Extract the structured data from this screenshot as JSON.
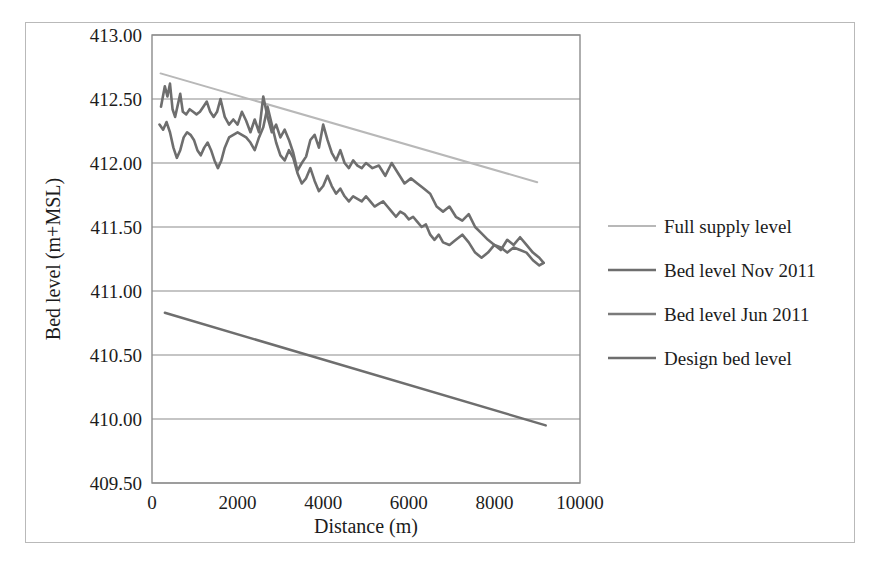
{
  "chart_data": {
    "type": "line",
    "title": "",
    "xlabel": "Distance (m)",
    "ylabel": "Bed level (m+MSL)",
    "xlim": [
      0,
      10000
    ],
    "ylim": [
      409.5,
      413.0
    ],
    "xticks": [
      "0",
      "2000",
      "4000",
      "6000",
      "8000",
      "10000"
    ],
    "xtick_values": [
      0,
      2000,
      4000,
      6000,
      8000,
      10000
    ],
    "yticks": [
      "409.50",
      "410.00",
      "410.50",
      "411.00",
      "411.50",
      "412.00",
      "412.50",
      "413.00"
    ],
    "ytick_values": [
      409.5,
      410.0,
      410.5,
      411.0,
      411.5,
      412.0,
      412.5,
      413.0
    ],
    "grid": "horizontal",
    "legend_position": "right",
    "series": [
      {
        "name": "Full supply level",
        "color": "#b8b8b8",
        "width": 2,
        "x": [
          200,
          9000
        ],
        "y": [
          412.7,
          411.85
        ]
      },
      {
        "name": "Bed level Nov 2011",
        "color": "#6e6e6e",
        "width": 2.6,
        "x": [
          210,
          300,
          360,
          420,
          480,
          540,
          600,
          660,
          720,
          800,
          880,
          960,
          1040,
          1120,
          1200,
          1280,
          1360,
          1440,
          1520,
          1600,
          1700,
          1800,
          1900,
          2000,
          2100,
          2200,
          2300,
          2400,
          2500,
          2600,
          2700,
          2800,
          2900,
          3000,
          3100,
          3200,
          3300,
          3400,
          3500,
          3600,
          3700,
          3800,
          3900,
          4000,
          4100,
          4200,
          4300,
          4400,
          4500,
          4600,
          4700,
          4800,
          4900,
          5000,
          5150,
          5300,
          5450,
          5600,
          5750,
          5900,
          6050,
          6200,
          6350,
          6500,
          6650,
          6800,
          6950,
          7100,
          7250,
          7400,
          7550,
          7700,
          7850,
          8000,
          8150,
          8300,
          8450,
          8600,
          8750,
          8900,
          9050,
          9150
        ],
        "y": [
          412.44,
          412.6,
          412.52,
          412.62,
          412.42,
          412.36,
          412.45,
          412.54,
          412.4,
          412.38,
          412.42,
          412.4,
          412.38,
          412.4,
          412.44,
          412.48,
          412.4,
          412.36,
          412.4,
          412.5,
          412.36,
          412.3,
          412.34,
          412.3,
          412.4,
          412.33,
          412.24,
          412.34,
          412.24,
          412.52,
          412.36,
          412.24,
          412.3,
          412.2,
          412.26,
          412.18,
          412.08,
          411.94,
          412.0,
          412.05,
          412.18,
          412.22,
          412.12,
          412.3,
          412.18,
          412.08,
          412.02,
          412.1,
          412.0,
          411.96,
          412.02,
          411.98,
          411.96,
          412.0,
          411.96,
          411.98,
          411.9,
          412.0,
          411.92,
          411.84,
          411.88,
          411.84,
          411.8,
          411.76,
          411.66,
          411.62,
          411.66,
          411.58,
          411.55,
          411.6,
          411.5,
          411.45,
          411.4,
          411.36,
          411.32,
          411.4,
          411.36,
          411.42,
          411.36,
          411.3,
          411.26,
          411.22
        ]
      },
      {
        "name": "Bed level Jun 2011",
        "color": "#6e6e6e",
        "width": 2.6,
        "x": [
          175,
          260,
          340,
          420,
          500,
          580,
          660,
          740,
          820,
          900,
          980,
          1060,
          1140,
          1220,
          1300,
          1380,
          1460,
          1540,
          1620,
          1700,
          1800,
          1900,
          2000,
          2100,
          2200,
          2300,
          2400,
          2500,
          2600,
          2700,
          2800,
          2900,
          3000,
          3100,
          3200,
          3300,
          3400,
          3500,
          3600,
          3700,
          3800,
          3900,
          4000,
          4100,
          4200,
          4300,
          4400,
          4500,
          4600,
          4700,
          4800,
          4900,
          5000,
          5100,
          5200,
          5300,
          5400,
          5500,
          5600,
          5700,
          5800,
          5900,
          6000,
          6100,
          6200,
          6300,
          6400,
          6500,
          6600,
          6700,
          6800,
          6950,
          7100,
          7250,
          7400,
          7550,
          7700,
          7850,
          8000,
          8150,
          8300,
          8450,
          8600,
          8750,
          8900,
          9050,
          9150
        ],
        "y": [
          412.3,
          412.26,
          412.32,
          412.24,
          412.12,
          412.04,
          412.1,
          412.2,
          412.24,
          412.22,
          412.18,
          412.1,
          412.06,
          412.12,
          412.16,
          412.1,
          412.02,
          411.96,
          412.02,
          412.12,
          412.2,
          412.22,
          412.24,
          412.22,
          412.2,
          412.16,
          412.1,
          412.2,
          412.28,
          412.44,
          412.3,
          412.16,
          412.06,
          412.02,
          412.1,
          412.04,
          411.92,
          411.84,
          411.88,
          411.96,
          411.86,
          411.78,
          411.82,
          411.9,
          411.82,
          411.76,
          411.8,
          411.74,
          411.7,
          411.74,
          411.72,
          411.7,
          411.74,
          411.7,
          411.66,
          411.68,
          411.7,
          411.66,
          411.62,
          411.58,
          411.62,
          411.6,
          411.56,
          411.58,
          411.54,
          411.5,
          411.52,
          411.44,
          411.4,
          411.44,
          411.38,
          411.36,
          411.4,
          411.44,
          411.38,
          411.3,
          411.26,
          411.3,
          411.36,
          411.34,
          411.3,
          411.34,
          411.32,
          411.3,
          411.24,
          411.2,
          411.22
        ]
      },
      {
        "name": "Design bed level",
        "color": "#6e6e6e",
        "width": 2.4,
        "x": [
          300,
          9200
        ],
        "y": [
          410.83,
          409.95
        ]
      }
    ]
  },
  "legend": {
    "items": [
      {
        "label": "Full supply level",
        "color": "#b8b8b8"
      },
      {
        "label": "Bed level Nov 2011",
        "color": "#6e6e6e"
      },
      {
        "label": "Bed level Jun 2011",
        "color": "#7a7a7a"
      },
      {
        "label": "Design bed level",
        "color": "#6e6e6e"
      }
    ]
  },
  "axes": {
    "x_title": "Distance (m)",
    "y_title": "Bed level (m+MSL)"
  },
  "colors": {
    "plot_frame": "#8c8c8c",
    "gridline": "#8c8c8c",
    "outer_border": "#b9b9b9",
    "text": "#1c1c1c"
  }
}
